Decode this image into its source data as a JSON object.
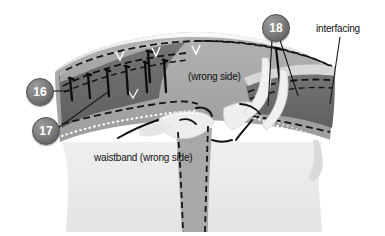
{
  "figure": {
    "type": "sewing-illustration"
  },
  "callouts": [
    {
      "id": "c16",
      "number": "16",
      "x": 26,
      "y": 78
    },
    {
      "id": "c17",
      "number": "17",
      "x": 32,
      "y": 117
    },
    {
      "id": "c18",
      "number": "18",
      "x": 262,
      "y": 14
    }
  ],
  "labels": [
    {
      "id": "wrong-side",
      "text": "(wrong side)",
      "x": 188,
      "y": 71
    },
    {
      "id": "waistband",
      "text": "waistband (wrong side)",
      "x": 94,
      "y": 152
    },
    {
      "id": "interfacing",
      "text": "interfacing",
      "x": 316,
      "y": 23
    }
  ],
  "colors": {
    "background": "#ffffff",
    "garment_light": "#e9e9e9",
    "band_medium": "#a6a6a6",
    "band_dark": "#6b6b6b",
    "band_darker": "#5d5d5d",
    "highlight": "#f2f2f2",
    "stitch": "#111111",
    "dotted": "#ffffff",
    "callout_fill": "#6f6f6f",
    "callout_text": "#ffffff",
    "label_text": "#111111"
  }
}
